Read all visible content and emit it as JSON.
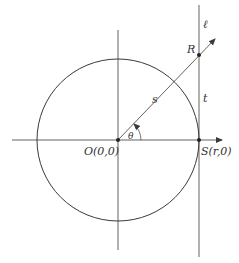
{
  "diagram": {
    "type": "geometry",
    "colors": {
      "stroke": "#3a3a3a",
      "background": "#ffffff",
      "text": "#333333"
    },
    "labels": {
      "line_l": "ℓ",
      "point_R": "R",
      "segment_s": "s",
      "segment_t": "t",
      "angle_theta": "θ",
      "origin": "O(0,0)",
      "point_S": "S(r,0)"
    },
    "points": [
      {
        "name": "O",
        "coords": "(0,0)"
      },
      {
        "name": "S",
        "coords": "(r,0)"
      },
      {
        "name": "R"
      }
    ]
  }
}
